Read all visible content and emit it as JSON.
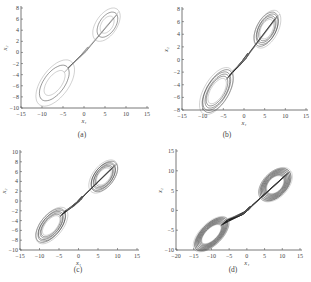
{
  "chart_data": [
    {
      "type": "line",
      "panel": "(a)",
      "title": "",
      "xlabel": "x1",
      "ylabel": "x2",
      "xlim": [
        -15,
        15
      ],
      "ylim": [
        -10,
        8
      ],
      "xticks": [
        "-15",
        "-10",
        "-5",
        "0",
        "5",
        "10",
        "15"
      ],
      "yticks": [
        "-10",
        "-8",
        "-6",
        "-4",
        "-2",
        "0",
        "2",
        "4",
        "6",
        "8"
      ],
      "description": "Phase portrait, butterfly-shaped attractor with few loops; lobes centered near (5,5) and (-8,-6)",
      "loops": 3,
      "lobe_pos": {
        "cx": 5.5,
        "cy": 5,
        "rx": 3.5,
        "ry": 2
      },
      "lobe_neg": {
        "cx": -7,
        "cy": -5.5,
        "rx": 5,
        "ry": 2.5
      },
      "grid": false
    },
    {
      "type": "line",
      "panel": "(b)",
      "title": "",
      "xlabel": "x1",
      "ylabel": "x2",
      "xlim": [
        -15,
        15
      ],
      "ylim": [
        -8,
        8
      ],
      "xticks": [
        "-15",
        "-10",
        "-5",
        "0",
        "5",
        "10",
        "15"
      ],
      "yticks": [
        "-8",
        "-6",
        "-4",
        "-2",
        "0",
        "2",
        "4",
        "6",
        "8"
      ],
      "description": "Phase portrait, denser butterfly attractor; lobes near (5,5) and (-7,-5.5)",
      "loops": 6,
      "lobe_pos": {
        "cx": 5.5,
        "cy": 4.8,
        "rx": 3.5,
        "ry": 2
      },
      "lobe_neg": {
        "cx": -6.5,
        "cy": -5,
        "rx": 4.5,
        "ry": 2.2
      },
      "grid": false
    },
    {
      "type": "line",
      "panel": "(c)",
      "title": "",
      "xlabel": "x1",
      "ylabel": "x2",
      "xlim": [
        -15,
        15
      ],
      "ylim": [
        -10,
        10
      ],
      "xticks": [
        "-15",
        "-10",
        "-5",
        "0",
        "5",
        "10",
        "15"
      ],
      "yticks": [
        "-10",
        "-8",
        "-6",
        "-4",
        "-2",
        "0",
        "2",
        "4",
        "6",
        "8",
        "10"
      ],
      "description": "Phase portrait, symmetric double-scroll attractor; lobes near (6,5) and (-7,-5)",
      "loops": 7,
      "lobe_pos": {
        "cx": 6.5,
        "cy": 5,
        "rx": 4,
        "ry": 2.2
      },
      "lobe_neg": {
        "cx": -7,
        "cy": -5,
        "rx": 4.5,
        "ry": 2.2
      },
      "grid": false
    },
    {
      "type": "line",
      "panel": "(d)",
      "title": "",
      "xlabel": "x1",
      "ylabel": "x2",
      "xlim": [
        -20,
        15
      ],
      "ylim": [
        -10,
        15
      ],
      "xticks": [
        "-20",
        "-15",
        "-10",
        "-5",
        "0",
        "5",
        "10",
        "15"
      ],
      "yticks": [
        "-10",
        "-5",
        "0",
        "5",
        "10",
        "15"
      ],
      "description": "Phase portrait, very dense double-scroll attractor; lobes near (8,7) and (-10,-6)",
      "loops": 14,
      "lobe_pos": {
        "cx": 8,
        "cy": 6.5,
        "rx": 5,
        "ry": 3
      },
      "lobe_neg": {
        "cx": -10,
        "cy": -6,
        "rx": 5.5,
        "ry": 2.5
      },
      "grid": false
    }
  ],
  "captions": [
    "(a)",
    "(b)",
    "(c)",
    "(d)"
  ],
  "axis_labels": {
    "x": "x₁",
    "y": "x₂"
  }
}
